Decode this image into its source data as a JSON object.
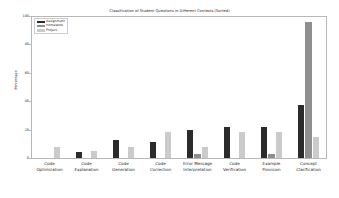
{
  "chart_data": {
    "type": "bar",
    "title": "Classification of Student Questions in Different Contexts (Sorted)",
    "xlabel": "",
    "ylabel": "Percentage",
    "ylim": [
      0,
      100
    ],
    "yticks": [
      0,
      20,
      40,
      60,
      80,
      100
    ],
    "grid": false,
    "legend_position": "upper left",
    "categories": [
      "Code\nOptimization",
      "Code\nExplanation",
      "Code\nGeneration",
      "Code\nCorrection",
      "Error Message\nInterpretation",
      "Code\nVerification",
      "Example\nProvision",
      "Concept\nClarification"
    ],
    "series": [
      {
        "name": "Assignment",
        "color": "#2b2b2b",
        "values": [
          0,
          4,
          13,
          11,
          20,
          22,
          22,
          37
        ]
      },
      {
        "name": "Homework",
        "color": "#8f8f8f",
        "values": [
          0,
          0,
          0,
          0,
          3,
          0,
          3,
          96
        ]
      },
      {
        "name": "Project",
        "color": "#cbcbcb",
        "values": [
          8,
          5,
          8,
          18,
          8,
          18,
          18,
          15
        ]
      }
    ]
  },
  "axis": {
    "tick_labels": [
      "0",
      "20",
      "40",
      "60",
      "80",
      "100"
    ]
  }
}
